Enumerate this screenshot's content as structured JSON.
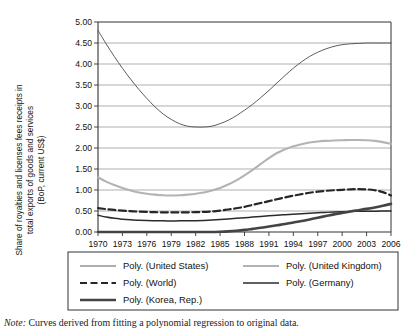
{
  "chart_data": {
    "type": "line",
    "title": "",
    "xlabel": "",
    "ylabel": "Share of royalties and licenses fees receipts in total exports of goods and services (BoP, current US$)",
    "ylabel_line1": "Share of royalties and licenses fees receipts in",
    "ylabel_line2": "total exports of goods and services",
    "ylabel_line3": "(BoP, current US$)",
    "xlim": [
      1970,
      2006
    ],
    "ylim": [
      0.0,
      5.0
    ],
    "grid": true,
    "legend_position": "below",
    "xticks": [
      1970,
      1973,
      1976,
      1979,
      1982,
      1985,
      1988,
      1991,
      1994,
      1997,
      2000,
      2003,
      2006
    ],
    "xtick_labels": [
      "1970",
      "1973",
      "1976",
      "1979",
      "1982",
      "1985",
      "1988",
      "1991",
      "1994",
      "1997",
      "2000",
      "2003",
      "2006"
    ],
    "yticks": [
      0.0,
      0.5,
      1.0,
      1.5,
      2.0,
      2.5,
      3.0,
      3.5,
      4.0,
      4.5,
      5.0
    ],
    "ytick_labels": [
      "0.00",
      "0.50",
      "1.00",
      "1.50",
      "2.00",
      "2.50",
      "3.00",
      "3.50",
      "4.00",
      "4.50",
      "5.00"
    ],
    "x": [
      1970,
      1971,
      1972,
      1973,
      1974,
      1975,
      1976,
      1977,
      1978,
      1979,
      1980,
      1981,
      1982,
      1983,
      1984,
      1985,
      1986,
      1987,
      1988,
      1989,
      1990,
      1991,
      1992,
      1993,
      1994,
      1995,
      1996,
      1997,
      1998,
      1999,
      2000,
      2001,
      2002,
      2003,
      2004,
      2005,
      2006
    ],
    "series": [
      {
        "name": "Poly. (United States)",
        "key": "united_states",
        "color": "#4a4a4a",
        "width": 0.9,
        "dash": "none",
        "values": [
          4.8,
          4.48,
          4.18,
          3.9,
          3.64,
          3.4,
          3.18,
          2.98,
          2.81,
          2.68,
          2.58,
          2.52,
          2.5,
          2.5,
          2.52,
          2.58,
          2.66,
          2.77,
          2.9,
          3.04,
          3.2,
          3.37,
          3.55,
          3.73,
          3.9,
          4.05,
          4.18,
          4.28,
          4.36,
          4.42,
          4.46,
          4.48,
          4.49,
          4.5,
          4.5,
          4.5,
          4.5
        ]
      },
      {
        "name": "Poly. (United Kingdom)",
        "key": "united_kingdom",
        "color": "#b3b3b3",
        "width": 2.1,
        "dash": "none",
        "values": [
          1.3,
          1.2,
          1.12,
          1.05,
          0.99,
          0.94,
          0.91,
          0.89,
          0.875,
          0.87,
          0.875,
          0.89,
          0.91,
          0.94,
          0.99,
          1.05,
          1.13,
          1.23,
          1.35,
          1.48,
          1.62,
          1.76,
          1.88,
          1.97,
          2.04,
          2.09,
          2.13,
          2.155,
          2.17,
          2.18,
          2.185,
          2.19,
          2.19,
          2.185,
          2.17,
          2.14,
          2.1
        ]
      },
      {
        "name": "Poly. (World)",
        "key": "world",
        "color": "#262626",
        "width": 2.2,
        "dash": "7,3.5",
        "values": [
          0.57,
          0.545,
          0.525,
          0.51,
          0.495,
          0.485,
          0.478,
          0.472,
          0.468,
          0.466,
          0.466,
          0.468,
          0.472,
          0.478,
          0.49,
          0.51,
          0.535,
          0.565,
          0.6,
          0.645,
          0.69,
          0.735,
          0.78,
          0.825,
          0.865,
          0.9,
          0.935,
          0.96,
          0.98,
          0.995,
          1.005,
          1.015,
          1.02,
          1.015,
          0.995,
          0.95,
          0.87
        ]
      },
      {
        "name": "Poly. (Germany)",
        "key": "germany",
        "color": "#2b2b2b",
        "width": 1.5,
        "dash": "none",
        "values": [
          0.4,
          0.355,
          0.325,
          0.305,
          0.29,
          0.28,
          0.272,
          0.268,
          0.265,
          0.264,
          0.265,
          0.267,
          0.27,
          0.275,
          0.283,
          0.295,
          0.31,
          0.325,
          0.34,
          0.355,
          0.37,
          0.385,
          0.4,
          0.413,
          0.425,
          0.437,
          0.448,
          0.458,
          0.467,
          0.475,
          0.482,
          0.488,
          0.492,
          0.495,
          0.497,
          0.498,
          0.5
        ]
      },
      {
        "name": "Poly. (Korea, Rep.)",
        "key": "korea_rep",
        "color": "#444444",
        "width": 2.6,
        "dash": "none",
        "values": [
          0.0,
          0.0,
          0.0,
          0.0,
          0.0,
          0.0,
          0.0,
          0.0,
          0.0,
          0.0,
          0.0,
          0.0,
          0.0,
          0.0,
          0.0,
          0.005,
          0.015,
          0.03,
          0.05,
          0.075,
          0.1,
          0.13,
          0.16,
          0.19,
          0.225,
          0.26,
          0.3,
          0.34,
          0.38,
          0.42,
          0.455,
          0.49,
          0.52,
          0.55,
          0.585,
          0.625,
          0.67
        ]
      }
    ]
  },
  "legend": {
    "entries": [
      {
        "label": "Poly. (United States)",
        "key": "united_states"
      },
      {
        "label": "Poly. (United Kingdom)",
        "key": "united_kingdom"
      },
      {
        "label": "Poly. (World)",
        "key": "world"
      },
      {
        "label": "Poly. (Germany)",
        "key": "germany"
      },
      {
        "label": "Poly. (Korea, Rep.)",
        "key": "korea_rep"
      }
    ]
  },
  "note": {
    "lead": "Note:",
    "text": " Curves derived from fitting a polynomial regression to original data."
  }
}
